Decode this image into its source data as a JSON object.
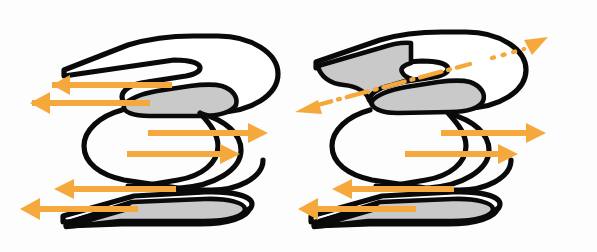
{
  "figure": {
    "title": "Flexural slip folding diagrams",
    "width": 597,
    "height": 252,
    "background_color": "#fdfdfd"
  },
  "palette": {
    "outline": "#0a0a0a",
    "bed_fill_white": "#ffffff",
    "bed_fill_gray": "#c9c9c9",
    "slip_arrow": "#f5a93c",
    "axis_line": "#f5a93c"
  },
  "panels": [
    {
      "id": "left-panel",
      "name": "upright-fold-diagram",
      "label": "",
      "has_fold_axis_line": false,
      "fold_axis_plunge": "horizontal",
      "arrows": [
        {
          "id": "l-top-upper",
          "name": "slip-arrow-top-upper-left",
          "direction": "left",
          "head": "single",
          "x1": 172,
          "y1": 85,
          "x2": 38,
          "y2": 85
        },
        {
          "id": "l-top-lower",
          "name": "slip-arrow-top-lower-left",
          "direction": "left",
          "head": "single",
          "x1": 150,
          "y1": 103,
          "x2": 17,
          "y2": 103
        },
        {
          "id": "l-mid-upper",
          "name": "slip-arrow-mid-upper-right",
          "direction": "right",
          "head": "single",
          "x1": 148,
          "y1": 133,
          "x2": 268,
          "y2": 133
        },
        {
          "id": "l-mid-lower",
          "name": "slip-arrow-mid-lower-right",
          "direction": "right",
          "head": "single",
          "x1": 127,
          "y1": 154,
          "x2": 240,
          "y2": 154
        },
        {
          "id": "l-bot-upper",
          "name": "slip-arrow-bottom-upper-left",
          "direction": "left",
          "head": "single",
          "x1": 176,
          "y1": 189,
          "x2": 54,
          "y2": 189
        },
        {
          "id": "l-bot-lower",
          "name": "slip-arrow-bottom-lower-left",
          "direction": "left",
          "head": "single",
          "x1": 138,
          "y1": 209,
          "x2": 20,
          "y2": 209
        }
      ]
    },
    {
      "id": "right-panel",
      "name": "plunging-fold-diagram",
      "label": "",
      "has_fold_axis_line": true,
      "fold_axis_plunge": "inclined",
      "axis_line_style": "dash-dot",
      "axis_line_endpoints": {
        "x1": 296,
        "y1": 109,
        "x2": 540,
        "y2": 42
      },
      "arrows": [
        {
          "id": "r-axis-sw",
          "name": "fold-axis-arrow-southwest",
          "direction": "left-up",
          "head": "single",
          "x1": 462,
          "y1": 78,
          "x2": 296,
          "y2": 110
        },
        {
          "id": "r-axis-ne",
          "name": "fold-axis-arrow-northeast",
          "direction": "right-up",
          "head": "single",
          "x1": 498,
          "y1": 58,
          "x2": 545,
          "y2": 40
        },
        {
          "id": "r-mid-upper",
          "name": "slip-arrow-mid-upper-right",
          "direction": "right",
          "head": "single",
          "x1": 441,
          "y1": 133,
          "x2": 545,
          "y2": 133
        },
        {
          "id": "r-mid-lower",
          "name": "slip-arrow-mid-lower-right",
          "direction": "right",
          "head": "single",
          "x1": 405,
          "y1": 154,
          "x2": 520,
          "y2": 154
        },
        {
          "id": "r-bot-upper",
          "name": "slip-arrow-bottom-upper-left",
          "direction": "left",
          "head": "single",
          "x1": 454,
          "y1": 189,
          "x2": 332,
          "y2": 189
        },
        {
          "id": "r-bot-lower",
          "name": "slip-arrow-bottom-lower-left",
          "direction": "left",
          "head": "single",
          "x1": 416,
          "y1": 209,
          "x2": 298,
          "y2": 209
        }
      ]
    }
  ],
  "legend": {
    "gray_bed_meaning": "shaded marker bed",
    "arrow_meaning": "sense of bedding-plane slip",
    "dashdot_meaning": "fold axis"
  }
}
